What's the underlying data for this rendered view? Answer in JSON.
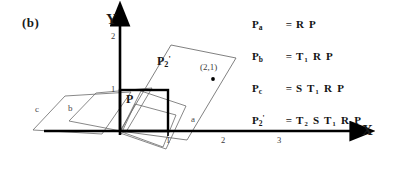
{
  "figure": {
    "panel_label": "(b)",
    "background_color": "#ffffff",
    "ink_color": "#000000",
    "thin_line_color": "#555555"
  },
  "axes": {
    "x_axis_name": "X",
    "y_axis_name": "Y",
    "x_ticks": [
      "1",
      "2",
      "3"
    ],
    "y_ticks": [
      "1",
      "2"
    ],
    "origin_px": [
      120,
      131
    ]
  },
  "shapes": [
    {
      "id": "c",
      "label": "c",
      "kind": "parallelogram-outline"
    },
    {
      "id": "b",
      "label": "b",
      "kind": "parallelogram-outline"
    },
    {
      "id": "a",
      "label": "a",
      "kind": "parallelogram-outline"
    },
    {
      "id": "P",
      "label": "P",
      "kind": "unit-square-bold"
    },
    {
      "id": "P2prime",
      "label": "P2'",
      "kind": "parallelogram-outline"
    }
  ],
  "point_labels": {
    "p_square": "P",
    "p2_prime_base": "P",
    "p2_prime_sub": "2",
    "p2_prime_prime": "'",
    "coordinate": "(2,1)"
  },
  "equations": [
    {
      "lhs_base": "P",
      "lhs_sub": "a",
      "lhs_prime": "",
      "eq": "=",
      "rhs": "R P"
    },
    {
      "lhs_base": "P",
      "lhs_sub": "b",
      "lhs_prime": "",
      "eq": "=",
      "rhs": "T₁ R P"
    },
    {
      "lhs_base": "P",
      "lhs_sub": "c",
      "lhs_prime": "",
      "eq": "=",
      "rhs": "S T₁ R P"
    },
    {
      "lhs_base": "P",
      "lhs_sub": "2",
      "lhs_prime": "'",
      "eq": "=",
      "rhs": "T₂ S T₁ R P"
    }
  ]
}
